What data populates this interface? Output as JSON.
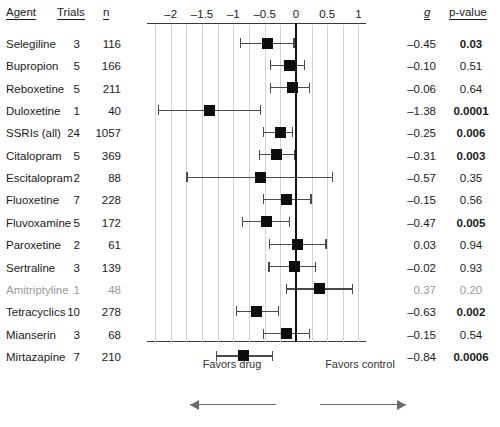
{
  "figure": {
    "type": "forest-plot",
    "columns": {
      "agent": "Agent",
      "trials": "Trials",
      "n": "n",
      "g": "g",
      "pvalue": "p-value"
    },
    "footer": {
      "favors_drug": "Favors drug",
      "favors_control": "Favors control",
      "left_arrow": "left-arrow-icon",
      "right_arrow": "right-arrow-icon"
    }
  },
  "chart_data": {
    "type": "forest",
    "title": "",
    "xlabel": "",
    "ylabel": "",
    "xlim": [
      -2.38,
      1.12
    ],
    "xticks": [
      -2,
      -1.5,
      -1,
      -0.5,
      0,
      0.5,
      1
    ],
    "xticklabels": [
      "–2",
      "–1.5",
      "–1",
      "–0.5",
      "0",
      "0.5",
      "1"
    ],
    "gridlines": [
      -2.25,
      -2,
      -1.75,
      -1.5,
      -1.25,
      -1,
      -0.75,
      -0.5,
      -0.25,
      0.25,
      0.5,
      0.75,
      1
    ],
    "grid": true,
    "reference_line": 0,
    "effect_measure": "g",
    "rows": [
      {
        "agent": "Selegiline",
        "trials": "3",
        "n": "116",
        "g": "–0.45",
        "g_val": -0.45,
        "ci_low": -0.88,
        "ci_high": -0.03,
        "p": "0.03",
        "p_bold": true,
        "faded": false
      },
      {
        "agent": "Bupropion",
        "trials": "5",
        "n": "166",
        "g": "–0.10",
        "g_val": -0.1,
        "ci_low": -0.4,
        "ci_high": 0.14,
        "p": "0.51",
        "p_bold": false,
        "faded": false
      },
      {
        "agent": "Reboxetine",
        "trials": "5",
        "n": "211",
        "g": "–0.06",
        "g_val": -0.06,
        "ci_low": -0.4,
        "ci_high": 0.22,
        "p": "0.64",
        "p_bold": false,
        "faded": false
      },
      {
        "agent": "Duloxetine",
        "trials": "1",
        "n": "40",
        "g": "–1.38",
        "g_val": -1.38,
        "ci_low": -2.2,
        "ci_high": -0.56,
        "p": "0.0001",
        "p_bold": true,
        "faded": false
      },
      {
        "agent": "SSRIs (all)",
        "trials": "24",
        "n": "1057",
        "g": "–0.25",
        "g_val": -0.25,
        "ci_low": -0.52,
        "ci_high": -0.06,
        "p": "0.006",
        "p_bold": true,
        "faded": false
      },
      {
        "agent": "Citalopram",
        "trials": "5",
        "n": "369",
        "g": "–0.31",
        "g_val": -0.31,
        "ci_low": -0.58,
        "ci_high": -0.02,
        "p": "0.003",
        "p_bold": true,
        "faded": false
      },
      {
        "agent": "Escitalopram",
        "trials": "2",
        "n": "88",
        "g": "–0.57",
        "g_val": -0.57,
        "ci_low": -1.74,
        "ci_high": 0.58,
        "p": "0.35",
        "p_bold": false,
        "faded": false
      },
      {
        "agent": "Fluoxetine",
        "trials": "7",
        "n": "228",
        "g": "–0.15",
        "g_val": -0.15,
        "ci_low": -0.52,
        "ci_high": 0.24,
        "p": "0.56",
        "p_bold": false,
        "faded": false
      },
      {
        "agent": "Fluvoxamine",
        "trials": "5",
        "n": "172",
        "g": "–0.47",
        "g_val": -0.47,
        "ci_low": -0.86,
        "ci_high": -0.1,
        "p": "0.005",
        "p_bold": true,
        "faded": false
      },
      {
        "agent": "Paroxetine",
        "trials": "2",
        "n": "61",
        "g": "0.03",
        "g_val": 0.03,
        "ci_low": -0.42,
        "ci_high": 0.48,
        "p": "0.94",
        "p_bold": false,
        "faded": false
      },
      {
        "agent": "Sertraline",
        "trials": "3",
        "n": "139",
        "g": "–0.02",
        "g_val": -0.02,
        "ci_low": -0.43,
        "ci_high": 0.31,
        "p": "0.93",
        "p_bold": false,
        "faded": false
      },
      {
        "agent": "Amitriptyline",
        "trials": "1",
        "n": "48",
        "g": "0.37",
        "g_val": 0.37,
        "ci_low": -0.15,
        "ci_high": 0.9,
        "p": "0.20",
        "p_bold": false,
        "faded": true
      },
      {
        "agent": "Tetracyclics",
        "trials": "10",
        "n": "278",
        "g": "–0.63",
        "g_val": -0.63,
        "ci_low": -0.95,
        "ci_high": -0.28,
        "p": "0.002",
        "p_bold": true,
        "faded": false
      },
      {
        "agent": "Mianserin",
        "trials": "3",
        "n": "68",
        "g": "–0.15",
        "g_val": -0.15,
        "ci_low": -0.52,
        "ci_high": 0.22,
        "p": "0.54",
        "p_bold": false,
        "faded": false
      },
      {
        "agent": "Mirtazapine",
        "trials": "7",
        "n": "210",
        "g": "–0.84",
        "g_val": -0.84,
        "ci_low": -1.27,
        "ci_high": -0.38,
        "p": "0.0006",
        "p_bold": true,
        "faded": false
      }
    ]
  }
}
